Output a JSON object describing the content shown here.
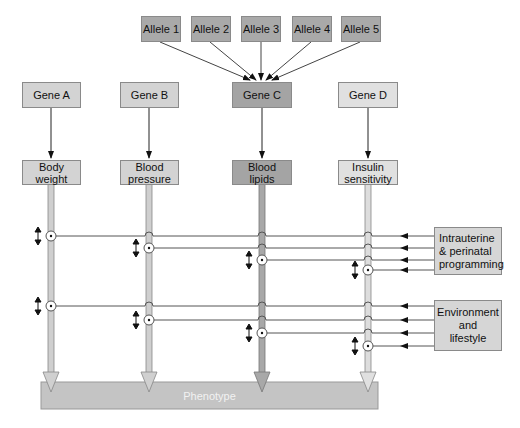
{
  "alleles": [
    {
      "label": "Allele 1",
      "x": 141,
      "cx": 160
    },
    {
      "label": "Allele 2",
      "x": 191,
      "cx": 210
    },
    {
      "label": "Allele 3",
      "x": 241,
      "cx": 261
    },
    {
      "label": "Allele 4",
      "x": 292,
      "cx": 311
    },
    {
      "label": "Allele 5",
      "x": 341,
      "cx": 360
    }
  ],
  "genes": [
    {
      "label": "Gene A",
      "cx": 51,
      "shade": "light"
    },
    {
      "label": "Gene B",
      "cx": 149,
      "shade": "light"
    },
    {
      "label": "Gene C",
      "cx": 262,
      "shade": "dark"
    },
    {
      "label": "Gene D",
      "cx": 368,
      "shade": "pale"
    }
  ],
  "traits": [
    {
      "label_line1": "Body",
      "label_line2": "weight",
      "cx": 51,
      "shade": "light"
    },
    {
      "label_line1": "Blood",
      "label_line2": "pressure",
      "cx": 149,
      "shade": "light"
    },
    {
      "label_line1": "Blood",
      "label_line2": "lipids",
      "cx": 262,
      "shade": "dark"
    },
    {
      "label_line1": "Insulin",
      "label_line2": "sensitivity",
      "cx": 368,
      "shade": "pale"
    }
  ],
  "influences": [
    {
      "label_line1": "Intrauterine",
      "label_line2": "& perinatal",
      "label_line3": "programming",
      "lines_y": [
        236,
        248,
        260,
        270
      ]
    },
    {
      "label_line1": "Environment",
      "label_line2": "and",
      "label_line3": "lifestyle",
      "lines_y": [
        306,
        320,
        333,
        346
      ]
    }
  ],
  "phenotype": {
    "label": "Phenotype"
  },
  "colors": {
    "allele": "#a9a9a9",
    "gene_light": "#d3d3d3",
    "gene_dark": "#a4a4a4",
    "gene_pale": "#e0e0e0",
    "phenotype": "#c4c4c4",
    "line": "#555555"
  }
}
